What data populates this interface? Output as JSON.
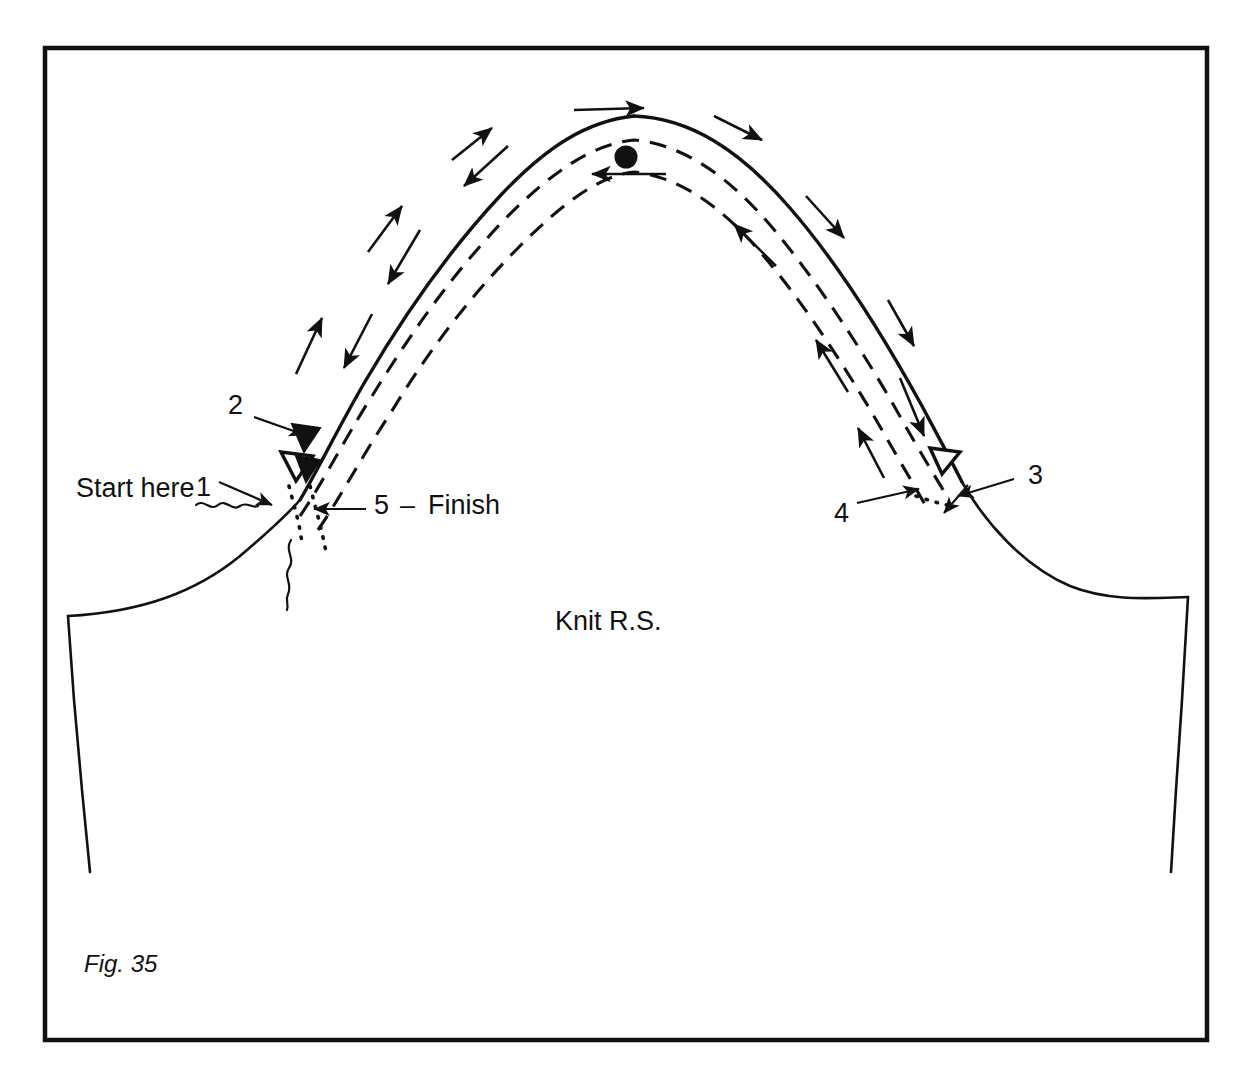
{
  "figure": {
    "caption": "Fig. 35",
    "frame_color": "#111111",
    "ink_color": "#111111",
    "background": "#ffffff"
  },
  "labels": {
    "start_here": "Start here",
    "step_1": "1",
    "step_2": "2",
    "step_3": "3",
    "step_4": "4",
    "step_5": "5",
    "dash_separator": "–",
    "finish": "Finish",
    "fabric_side": "Knit R.S."
  },
  "icons": {
    "notch_filled": "filled-triangle-notch-icon",
    "notch_outline": "outline-triangle-notch-icon",
    "center_dot": "center-match-dot-icon",
    "thread_tail": "thread-tail-squiggle-icon"
  },
  "diagram": {
    "lines": [
      {
        "name": "cap-seam-solid",
        "style": "solid"
      },
      {
        "name": "ease-stitch-row-outer",
        "style": "dashed"
      },
      {
        "name": "ease-stitch-row-inner",
        "style": "dashed"
      },
      {
        "name": "thread-tail-left",
        "style": "dotted"
      },
      {
        "name": "thread-tail-right",
        "style": "dotted"
      }
    ],
    "direction_arrows": {
      "left_outer": "up",
      "left_inner": "down",
      "top_outer": "right",
      "top_inner": "left",
      "right_outer": "down",
      "right_inner": "up"
    },
    "notch_count_left": 2,
    "notch_count_right": 1
  }
}
